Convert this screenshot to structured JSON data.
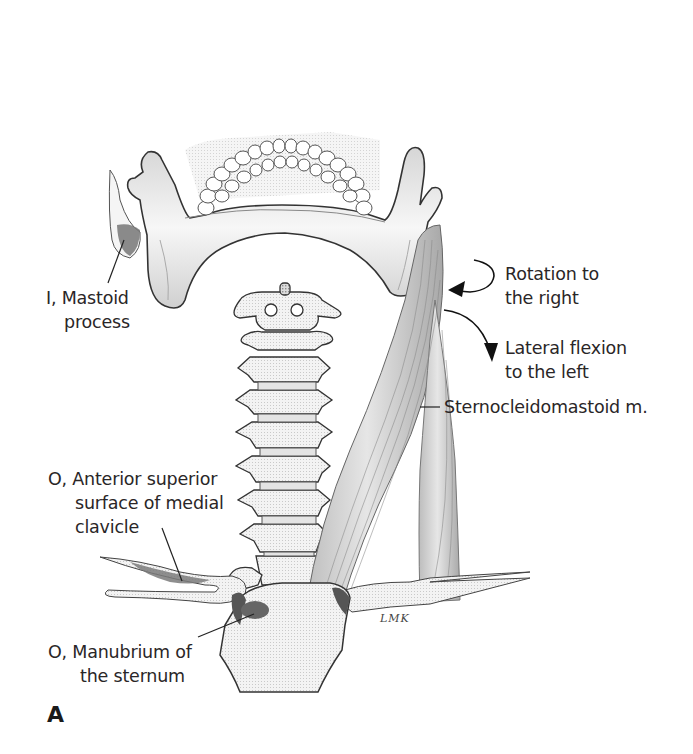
{
  "figure": {
    "panel_letter": "A",
    "artist_signature": "LMK",
    "palette": {
      "background": "#ffffff",
      "bone_fill": "#f4f4f4",
      "bone_outline": "#3a3a3a",
      "shading": "#9a9a9a",
      "muscle_fill": "#cfcfcf",
      "attachment_dark": "#6e6e6e",
      "text": "#2a2627"
    },
    "labels": {
      "insertion": {
        "prefix": "I,",
        "line1": "I, Mastoid",
        "line2": "process"
      },
      "rotation": {
        "line1": "Rotation to",
        "line2": "the right"
      },
      "lateral_flexion": {
        "line1": "Lateral flexion",
        "line2": "to the left"
      },
      "muscle": {
        "text": "Sternocleidomastoid m."
      },
      "origin_clavicle": {
        "line1": "O, Anterior superior",
        "line2": "surface of medial",
        "line3": "clavicle"
      },
      "origin_sternum": {
        "line1": "O, Manubrium of",
        "line2": "the sternum"
      }
    },
    "structures": [
      "mandible",
      "teeth",
      "mastoid-process",
      "cervical-vertebrae",
      "sternocleidomastoid-muscle",
      "clavicle-left",
      "clavicle-right",
      "manubrium"
    ],
    "arrows": [
      {
        "name": "rotation-arrow",
        "meaning": "Rotation to the right"
      },
      {
        "name": "lateral-flexion-arrow",
        "meaning": "Lateral flexion to the left"
      }
    ]
  }
}
